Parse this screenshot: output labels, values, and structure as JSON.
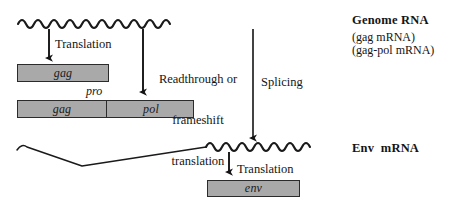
{
  "diagram": {
    "title_semantic": "retroviral-rna-expression-pathways",
    "colors": {
      "orf_fill": "#a9a9a9",
      "orf_stroke": "#2b2b2b",
      "line": "#1a1a1a",
      "background": "#ffffff"
    }
  },
  "genome": {
    "label_main": "Genome RNA",
    "label_alt_1": "(gag mRNA)",
    "label_alt_2": "(gag-pol mRNA)"
  },
  "env_rna": {
    "label_main": "Env  mRNA"
  },
  "arrows": {
    "translation_gag": "Translation",
    "readthrough_line_1": "Readthrough or",
    "readthrough_line_2": "frameshift",
    "readthrough_line_3": "translation",
    "splicing": "Splicing",
    "translation_env": "Translation"
  },
  "orfs": {
    "gag": "gag",
    "pro": "pro",
    "gag_pol_gag": "gag",
    "gag_pol_pol": "pol",
    "env": "env"
  }
}
